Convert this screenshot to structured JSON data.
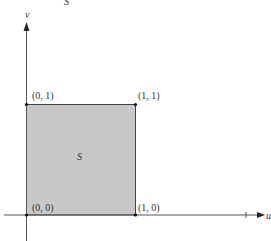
{
  "diagram": {
    "title": "S",
    "region_label": "S",
    "axes": {
      "horizontal_label": "u",
      "vertical_label": "v"
    },
    "corners": [
      {
        "id": "origin",
        "label": "(0, 0)"
      },
      {
        "id": "u1",
        "label": "(1, 0)"
      },
      {
        "id": "v1",
        "label": "(0, 1)"
      },
      {
        "id": "uv1",
        "label": "(1, 1)"
      }
    ],
    "colors": {
      "region_fill": "#c8c8c8",
      "axis": "#555555",
      "edge": "#444444",
      "text": "#333333"
    }
  }
}
